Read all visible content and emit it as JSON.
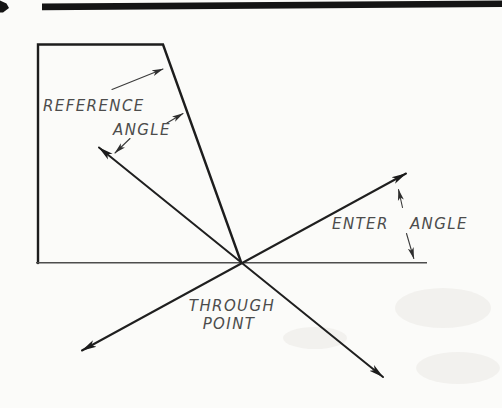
{
  "window": {
    "width": 502,
    "height": 408
  },
  "diagram": {
    "type": "technical-drafting-illustration",
    "labels": {
      "reference": "REFERENCE",
      "reference_angle": "ANGLE",
      "enter_angle": "ENTER ANGLE",
      "through_line1": "THROUGH",
      "through_line2": "POINT"
    },
    "colors": {
      "paper": "#fbfbf9",
      "heavy_line": "#1d1d1d",
      "thin_line": "#4d4d4d",
      "leader_line": "#3b3b3b",
      "lettering": "#4c4c4c",
      "top_rule": "#141414"
    }
  }
}
